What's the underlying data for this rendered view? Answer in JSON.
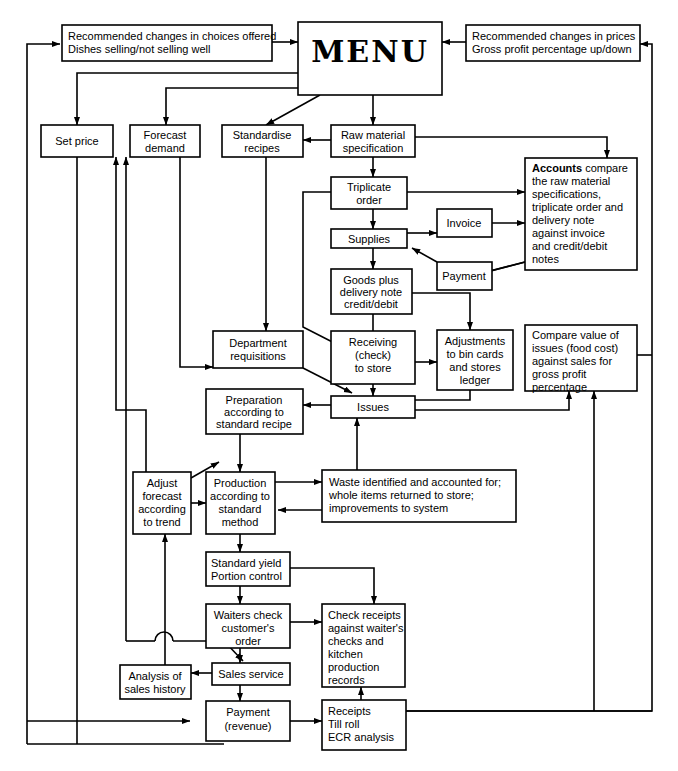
{
  "diagram": {
    "title": "MENU",
    "nodes": {
      "menu": {
        "label": "MENU"
      },
      "rec_choices": {
        "line1": "Recommended changes in choices offered",
        "line2": "Dishes selling/not selling well"
      },
      "rec_prices": {
        "line1": "Recommended changes in prices",
        "line2": "Gross profit percentage up/down"
      },
      "set_price": {
        "line1": "Set price"
      },
      "forecast": {
        "line1": "Forecast",
        "line2": "demand"
      },
      "standardise": {
        "line1": "Standardise",
        "line2": "recipes"
      },
      "raw_material": {
        "line1": "Raw material",
        "line2": "specification"
      },
      "accounts": {
        "bold": "Accounts",
        "rest": " compare",
        "line2": "the raw material",
        "line3": "specifications,",
        "line4": "triplicate order and",
        "line5": "delivery note",
        "line6": "against invoice",
        "line7": "and credit/debit",
        "line8": "notes"
      },
      "triplicate": {
        "line1": "Triplicate",
        "line2": "order"
      },
      "invoice": {
        "line1": "Invoice"
      },
      "supplies": {
        "line1": "Supplies"
      },
      "payment_sup": {
        "line1": "Payment"
      },
      "goods": {
        "line1": "Goods plus",
        "line2": "delivery note",
        "line3": "credit/debit"
      },
      "dept_req": {
        "line1": "Department",
        "line2": "requisitions"
      },
      "receiving": {
        "line1": "Receiving",
        "line2": "(check)",
        "line3": "to store"
      },
      "adjustments": {
        "line1": "Adjustments",
        "line2": "to bin cards",
        "line3": "and stores",
        "line4": "ledger"
      },
      "compare": {
        "line1": "Compare value of",
        "line2": "issues (food cost)",
        "line3": "against sales for",
        "line4": "gross profit",
        "line5": "percentage"
      },
      "preparation": {
        "line1": "Preparation",
        "line2": "according to",
        "line3": "standard recipe"
      },
      "issues": {
        "line1": "Issues"
      },
      "adjust_fc": {
        "line1": "Adjust",
        "line2": "forecast",
        "line3": "according",
        "line4": "to trend"
      },
      "production": {
        "line1": "Production",
        "line2": "according to",
        "line3": "standard",
        "line4": "method"
      },
      "waste": {
        "line1": "Waste identified and accounted for;",
        "line2": "whole items returned  to store;",
        "line3": "improvements to system"
      },
      "std_yield": {
        "line1": "Standard yield",
        "line2": "Portion control"
      },
      "waiters": {
        "line1": "Waiters check",
        "line2": "customer's",
        "line3": "order"
      },
      "check_rec": {
        "line1": "Check receipts",
        "line2": "against waiter's",
        "line3": "checks and",
        "line4": "kitchen",
        "line5": "production",
        "line6": "records"
      },
      "analysis": {
        "line1": "Analysis of",
        "line2": "sales history"
      },
      "sales_srv": {
        "line1": "Sales service"
      },
      "payment_rev": {
        "line1": "Payment",
        "line2": "(revenue)"
      },
      "receipts": {
        "line1": "Receipts",
        "line2": "Till roll",
        "line3": "ECR analysis"
      }
    },
    "colors": {
      "stroke": "#000000",
      "fill": "#ffffff",
      "background": "#ffffff"
    }
  }
}
